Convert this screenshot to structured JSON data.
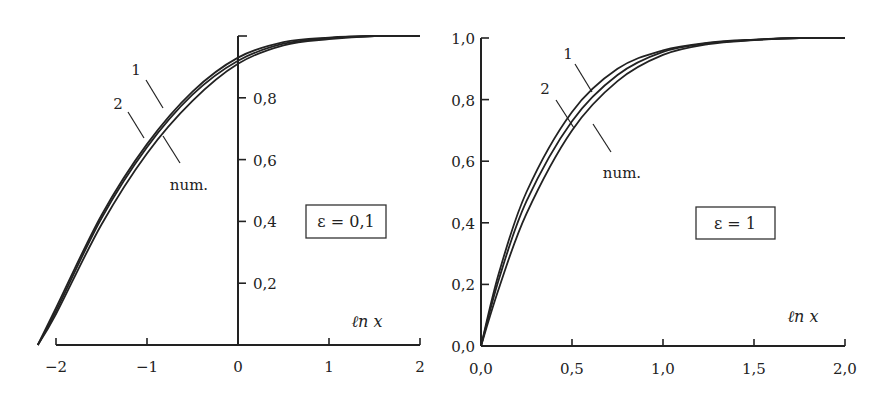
{
  "chart_data": [
    {
      "type": "line",
      "title": "",
      "box_label": "ε = 0,1",
      "xlabel": "ℓn x",
      "ylabel": "",
      "xlim": [
        -2.2,
        2
      ],
      "ylim": [
        0,
        1.0
      ],
      "x_ticks": [
        "−2",
        "−1",
        "0",
        "1",
        "2"
      ],
      "y_ticks": [
        "0,2",
        "0,4",
        "0,6",
        "0,8"
      ],
      "grid": false,
      "curve_labels": [
        "1",
        "2",
        "num."
      ],
      "x": [
        -2.2,
        -2.0,
        -1.5,
        -1.0,
        -0.5,
        0.0,
        0.5,
        1.0,
        1.5,
        2.0
      ],
      "series": [
        {
          "name": "1",
          "values": [
            0.0,
            0.12,
            0.42,
            0.65,
            0.82,
            0.93,
            0.98,
            0.995,
            1.0,
            1.0
          ]
        },
        {
          "name": "2",
          "values": [
            0.0,
            0.11,
            0.41,
            0.64,
            0.81,
            0.92,
            0.975,
            0.993,
            1.0,
            1.0
          ]
        },
        {
          "name": "num.",
          "values": [
            0.0,
            0.1,
            0.39,
            0.62,
            0.79,
            0.91,
            0.97,
            0.99,
            1.0,
            1.0
          ]
        }
      ]
    },
    {
      "type": "line",
      "title": "",
      "box_label": "ε = 1",
      "xlabel": "ℓn x",
      "ylabel": "",
      "xlim": [
        0,
        2.0
      ],
      "ylim": [
        0,
        1.0
      ],
      "x_ticks": [
        "0,0",
        "0,5",
        "1,0",
        "1,5",
        "2,0"
      ],
      "y_ticks": [
        "0,0",
        "0,2",
        "0,4",
        "0,6",
        "0,8",
        "1,0"
      ],
      "grid": false,
      "curve_labels": [
        "1",
        "2",
        "num."
      ],
      "x": [
        0.0,
        0.1,
        0.25,
        0.5,
        0.75,
        1.0,
        1.25,
        1.5,
        1.75,
        2.0
      ],
      "series": [
        {
          "name": "1",
          "values": [
            0.0,
            0.24,
            0.5,
            0.76,
            0.9,
            0.96,
            0.985,
            0.995,
            1.0,
            1.0
          ]
        },
        {
          "name": "2",
          "values": [
            0.0,
            0.22,
            0.47,
            0.73,
            0.88,
            0.955,
            0.983,
            0.994,
            1.0,
            1.0
          ]
        },
        {
          "name": "num.",
          "values": [
            0.0,
            0.19,
            0.43,
            0.7,
            0.86,
            0.945,
            0.98,
            0.993,
            1.0,
            1.0
          ]
        }
      ]
    }
  ]
}
